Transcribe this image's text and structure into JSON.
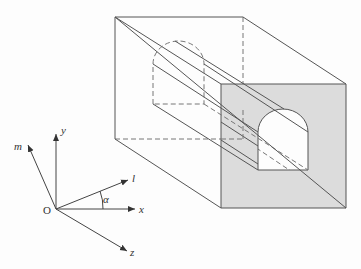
{
  "diagram": {
    "title": "",
    "colors": {
      "front_face_fill": "#dcdcdc",
      "opening_fill": "#ffffff",
      "line": "#555555",
      "hidden_line": "#777777"
    },
    "axes": {
      "origin_label": "O",
      "x_label": "x",
      "y_label": "y",
      "z_label": "z",
      "l_label": "l",
      "m_label": "m",
      "angle_label": "α"
    },
    "box": {
      "description": "Rectangular block with arched tunnel opening, front face shaded"
    }
  }
}
